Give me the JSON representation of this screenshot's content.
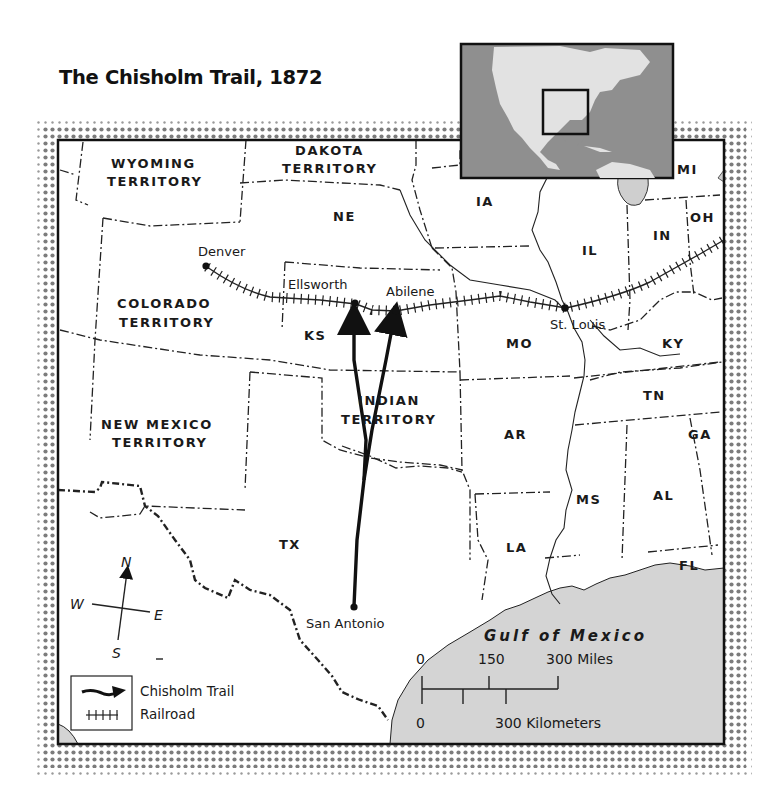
{
  "title": "The Chisholm Trail, 1872",
  "colors": {
    "land": "#ffffff",
    "water": "#d4d4d4",
    "inset_ocean": "#8f8f8f",
    "inset_land": "#e2e2e2",
    "frame": "#111111",
    "halftone": "#7a7a7a"
  },
  "territories": [
    {
      "id": "wyoming",
      "line1": "WYOMING",
      "line2": "TERRITORY"
    },
    {
      "id": "dakota",
      "line1": "DAKOTA",
      "line2": "TERRITORY"
    },
    {
      "id": "colorado",
      "line1": "COLORADO",
      "line2": "TERRITORY"
    },
    {
      "id": "new-mexico",
      "line1": "NEW MEXICO",
      "line2": "TERRITORY"
    },
    {
      "id": "indian",
      "line1": "INDIAN",
      "line2": "TERRITORY"
    }
  ],
  "states": {
    "NE": "NE",
    "IA": "IA",
    "IL": "IL",
    "IN": "IN",
    "OH": "OH",
    "MI": "MI",
    "KS": "KS",
    "MO": "MO",
    "KY": "KY",
    "TN": "TN",
    "AR": "AR",
    "GA": "GA",
    "AL": "AL",
    "MS": "MS",
    "LA": "LA",
    "FL": "FL",
    "TX": "TX"
  },
  "cities": {
    "denver": "Denver",
    "ellsworth": "Ellsworth",
    "abilene": "Abilene",
    "st_louis": "St. Louis",
    "san_antonio": "San Antonio"
  },
  "water_label": "Gulf of Mexico",
  "compass": {
    "n": "N",
    "s": "S",
    "e": "E",
    "w": "W"
  },
  "scale": {
    "miles_0": "0",
    "miles_mid": "150",
    "miles_end": "300 Miles",
    "km_0": "0",
    "km_end": "300 Kilometers"
  },
  "legend": {
    "trail": "Chisholm Trail",
    "railroad": "Railroad"
  }
}
